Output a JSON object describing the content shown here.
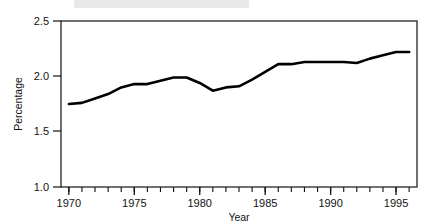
{
  "chart_data": {
    "type": "line",
    "title": "",
    "xlabel": "Year",
    "ylabel": "Percentage",
    "xlim": [
      1969.4,
      1996.6
    ],
    "ylim": [
      1.0,
      2.5
    ],
    "yticks": [
      "1.0",
      "1.5",
      "2.0",
      "2.5"
    ],
    "ytick_values": [
      1.0,
      1.5,
      2.0,
      2.5
    ],
    "xticks": [
      "1970",
      "1975",
      "1980",
      "1985",
      "1990",
      "1995"
    ],
    "xtick_values": [
      1970,
      1975,
      1980,
      1985,
      1990,
      1995
    ],
    "minor_xtick_values": [
      1970,
      1971,
      1972,
      1973,
      1974,
      1975,
      1976,
      1977,
      1978,
      1979,
      1980,
      1981,
      1982,
      1983,
      1984,
      1985,
      1986,
      1987,
      1988,
      1989,
      1990,
      1991,
      1992,
      1993,
      1994,
      1995,
      1996
    ],
    "grid": false,
    "legend": false,
    "line_color": "#000000",
    "line_width": 2.6,
    "x": [
      1970,
      1971,
      1972,
      1973,
      1974,
      1975,
      1976,
      1977,
      1978,
      1979,
      1980,
      1981,
      1982,
      1983,
      1984,
      1985,
      1986,
      1987,
      1988,
      1989,
      1990,
      1991,
      1992,
      1993,
      1994,
      1995,
      1996
    ],
    "values": [
      1.75,
      1.76,
      1.8,
      1.84,
      1.9,
      1.93,
      1.93,
      1.96,
      1.99,
      1.99,
      1.94,
      1.87,
      1.9,
      1.91,
      1.97,
      2.04,
      2.11,
      2.11,
      2.13,
      2.13,
      2.13,
      2.13,
      2.12,
      2.16,
      2.19,
      2.22,
      2.22
    ],
    "series": [
      {
        "name": "Percentage",
        "values": [
          1.75,
          1.76,
          1.8,
          1.84,
          1.9,
          1.93,
          1.93,
          1.96,
          1.99,
          1.99,
          1.94,
          1.87,
          1.9,
          1.91,
          1.97,
          2.04,
          2.11,
          2.11,
          2.13,
          2.13,
          2.13,
          2.13,
          2.12,
          2.16,
          2.19,
          2.22,
          2.22
        ]
      }
    ]
  },
  "axes": {
    "y_title": "Percentage",
    "x_title": "Year",
    "y_tick_labels": [
      "2.5",
      "2.0",
      "1.5",
      "1.0"
    ],
    "x_tick_labels": [
      "1970",
      "1975",
      "1980",
      "1985",
      "1990",
      "1995"
    ]
  }
}
